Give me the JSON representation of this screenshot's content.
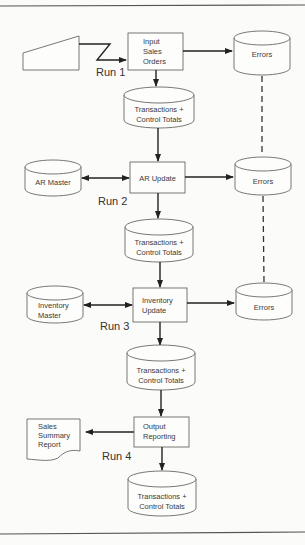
{
  "diagram": {
    "runs": [
      {
        "label": "Run 1",
        "process": {
          "lines": [
            "Input",
            "Sales",
            "Orders"
          ]
        },
        "input": {
          "type": "card-reader",
          "lines": []
        },
        "output": {
          "lines": [
            "Transactions +",
            "Control Totals"
          ]
        },
        "errors": {
          "lines": [
            "Errors"
          ]
        }
      },
      {
        "label": "Run 2",
        "process": {
          "lines": [
            "AR Update"
          ]
        },
        "master": {
          "lines": [
            "AR Master"
          ]
        },
        "output": {
          "lines": [
            "Transactions +",
            "Control Totals"
          ]
        },
        "errors": {
          "lines": [
            "Errors"
          ]
        }
      },
      {
        "label": "Run 3",
        "process": {
          "lines": [
            "Inventory",
            "Update"
          ]
        },
        "master": {
          "lines": [
            "Inventory",
            "Master"
          ]
        },
        "output": {
          "lines": [
            "Transactions +",
            "Control Totals"
          ]
        },
        "errors": {
          "lines": [
            "Errors"
          ]
        }
      },
      {
        "label": "Run 4",
        "process": {
          "lines": [
            "Output",
            "Reporting"
          ]
        },
        "report": {
          "lines": [
            "Sales",
            "Summary",
            "Report"
          ]
        },
        "output": {
          "lines": [
            "Transactions +",
            "Control Totals"
          ]
        }
      }
    ],
    "colors": {
      "line": "#222222",
      "shape_stroke": "#555555",
      "background": "#fbfbf9"
    }
  }
}
